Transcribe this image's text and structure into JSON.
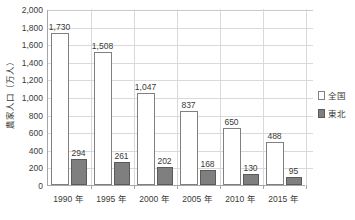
{
  "chart_data": {
    "type": "bar",
    "title": "",
    "xlabel": "",
    "ylabel": "農家人口（万人）",
    "categories": [
      "1990 年",
      "1995 年",
      "2000 年",
      "2005 年",
      "2010 年",
      "2015 年"
    ],
    "series": [
      {
        "name": "全国",
        "color": "#ffffff",
        "values": [
          1730,
          1508,
          1047,
          837,
          650,
          488
        ],
        "labels": [
          "1,730",
          "1,508",
          "1,047",
          "837",
          "650",
          "488"
        ]
      },
      {
        "name": "東北",
        "color": "#7f7f7f",
        "values": [
          294,
          261,
          202,
          168,
          130,
          95
        ],
        "labels": [
          "294",
          "261",
          "202",
          "168",
          "130",
          "95"
        ]
      }
    ],
    "ylim": [
      0,
      2000
    ],
    "ytick_values": [
      0,
      200,
      400,
      600,
      800,
      1000,
      1200,
      1400,
      1600,
      1800,
      2000
    ],
    "ytick_labels": [
      "0",
      "200",
      "400",
      "600",
      "800",
      "1,000",
      "1,200",
      "1,400",
      "1,600",
      "1,800",
      "2,000"
    ],
    "grid": true,
    "legend_position": "right"
  },
  "legend": {
    "items": [
      {
        "label": "全国"
      },
      {
        "label": "東北"
      }
    ]
  },
  "axes": {
    "y_title": "農家人口（万人）"
  }
}
